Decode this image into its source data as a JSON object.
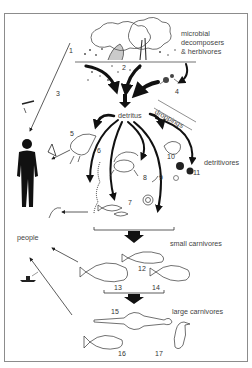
{
  "diagram": {
    "frame_color": "#8c8c8c",
    "ink_color": "#111111",
    "labels": {
      "microbial": [
        "microbial",
        "decomposers",
        "& herbivores"
      ],
      "detritus": "detritus",
      "droppings": "droppings",
      "detritivores": "detritivores",
      "people": "people",
      "small_carnivores": "small carnivores",
      "large_carnivores": "large carnivores"
    },
    "numbers": [
      "1",
      "2",
      "3",
      "4",
      "5",
      "6",
      "7",
      "8",
      "9",
      "10",
      "11",
      "12",
      "13",
      "14",
      "15",
      "16",
      "17"
    ],
    "nodes": [
      {
        "id": "1",
        "group": "producers",
        "depiction": "mangrove-tree-and-leaf-litter"
      },
      {
        "id": "2",
        "group": "producers",
        "depiction": "leaf-litter"
      },
      {
        "id": "3",
        "group": "harvest",
        "depiction": "mangrove-wood-harvest"
      },
      {
        "id": "4",
        "group": "microbial",
        "depiction": "crab-in-litter"
      },
      {
        "id": "5",
        "group": "detritivores",
        "depiction": "shrimp"
      },
      {
        "id": "6",
        "group": "detritivores",
        "depiction": "worm"
      },
      {
        "id": "7",
        "group": "detritivores",
        "depiction": "small-fish"
      },
      {
        "id": "8",
        "group": "detritivores",
        "depiction": "crab"
      },
      {
        "id": "9",
        "group": "detritivores",
        "depiction": "snail"
      },
      {
        "id": "10",
        "group": "detritivores",
        "depiction": "amphipod"
      },
      {
        "id": "11",
        "group": "detritivores",
        "depiction": "bivalves"
      },
      {
        "id": "12",
        "group": "small carnivores",
        "depiction": "snapper"
      },
      {
        "id": "13",
        "group": "small carnivores",
        "depiction": "bream"
      },
      {
        "id": "14",
        "group": "small carnivores",
        "depiction": "spotted-fish"
      },
      {
        "id": "15",
        "group": "large carnivores",
        "depiction": "sawfish"
      },
      {
        "id": "16",
        "group": "large carnivores",
        "depiction": "trevally"
      },
      {
        "id": "17",
        "group": "large carnivores",
        "depiction": "heron"
      }
    ],
    "edges": [
      {
        "from": "leaf-litter",
        "to": "detritus"
      },
      {
        "from": "4",
        "to": "detritus"
      },
      {
        "from": "droppings",
        "to": "detritus"
      },
      {
        "from": "detritus",
        "to": "5"
      },
      {
        "from": "detritus",
        "to": "6"
      },
      {
        "from": "detritus",
        "to": "7"
      },
      {
        "from": "detritus",
        "to": "8"
      },
      {
        "from": "detritus",
        "to": "9"
      },
      {
        "from": "detritus",
        "to": "10"
      },
      {
        "from": "detritus",
        "to": "11"
      },
      {
        "from": "detritivores",
        "to": "small carnivores"
      },
      {
        "from": "small carnivores",
        "to": "large carnivores"
      },
      {
        "from": "1",
        "to": "people"
      },
      {
        "from": "5",
        "to": "people"
      },
      {
        "from": "7",
        "to": "people"
      },
      {
        "from": "small carnivores",
        "to": "people"
      },
      {
        "from": "large carnivores",
        "to": "people"
      }
    ]
  }
}
